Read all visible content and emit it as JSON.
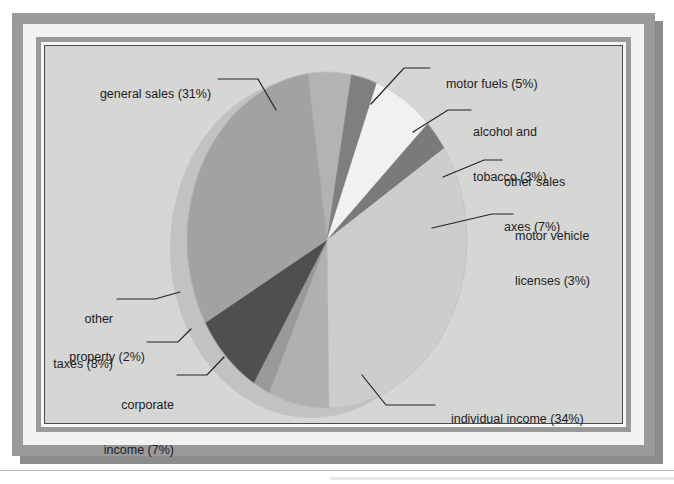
{
  "chart_data": {
    "type": "pie",
    "title": "",
    "legend_position": "callout-labels",
    "grid": false,
    "style": "3d-elliptical-exploded-none",
    "categories": [
      "motor fuels",
      "alcohol and tobacco",
      "other sales axes",
      "motor vehicle licenses",
      "individual income",
      "corporate income",
      "property",
      "other taxes",
      "general sales"
    ],
    "values": [
      5,
      3,
      7,
      3,
      34,
      7,
      2,
      8,
      31
    ],
    "unit": "%",
    "slices": [
      {
        "label": "motor fuels",
        "value": 5,
        "pct_text": "(5%)",
        "color": "#b3b3b3",
        "label_text": "motor fuels (5%)"
      },
      {
        "label": "alcohol and tobacco",
        "value": 3,
        "pct_text": "(3%)",
        "color": "#7f7f7f",
        "label_line1": "alcohol and",
        "label_line2": "tobacco (3%)"
      },
      {
        "label": "other sales axes",
        "value": 7,
        "pct_text": "(7%)",
        "color": "#f1f1ef",
        "label_line1": "other sales",
        "label_line2": "axes (7%)"
      },
      {
        "label": "motor vehicle licenses",
        "value": 3,
        "pct_text": "(3%)",
        "color": "#7a7a7a",
        "label_line1": "motor vehicle",
        "label_line2": "licenses (3%)"
      },
      {
        "label": "individual income",
        "value": 34,
        "pct_text": "(34%)",
        "color": "#cdcdcb",
        "label_text": "individual income (34%)"
      },
      {
        "label": "corporate income",
        "value": 7,
        "pct_text": "(7%)",
        "color": "#b0b0ae",
        "label_line1": "corporate",
        "label_line2": "income (7%)"
      },
      {
        "label": "property",
        "value": 2,
        "pct_text": "(2%)",
        "color": "#999997",
        "label_text": "property (2%)"
      },
      {
        "label": "other taxes",
        "value": 8,
        "pct_text": "(8%)",
        "color": "#4f4f4f",
        "label_line1": "other",
        "label_line2": "taxes (8%)"
      },
      {
        "label": "general sales",
        "value": 31,
        "pct_text": "(31%)",
        "color": "#a2a2a0",
        "label_text": "general sales (31%)"
      }
    ]
  },
  "labels": {
    "general_sales": "general sales (31%)",
    "motor_fuels": "motor fuels (5%)",
    "alcohol_tobacco_l1": "alcohol and",
    "alcohol_tobacco_l2": "tobacco (3%)",
    "other_sales_l1": "other sales",
    "other_sales_l2": "axes (7%)",
    "motor_vehicle_l1": "motor vehicle",
    "motor_vehicle_l2": "licenses (3%)",
    "individual_income": "individual income (34%)",
    "other_taxes_l1": "other",
    "other_taxes_l2": "taxes (8%)",
    "property": "property (2%)",
    "corporate_l1": "corporate",
    "corporate_l2": "income (7%)"
  },
  "colors": {
    "frame_gray": "#9a9a9a",
    "frame_white": "#f2f2f0",
    "plot_background": "#d6d6d4",
    "plot_border": "#4a4a4a",
    "leader_line": "#222222",
    "text": "#1d1d1d"
  }
}
